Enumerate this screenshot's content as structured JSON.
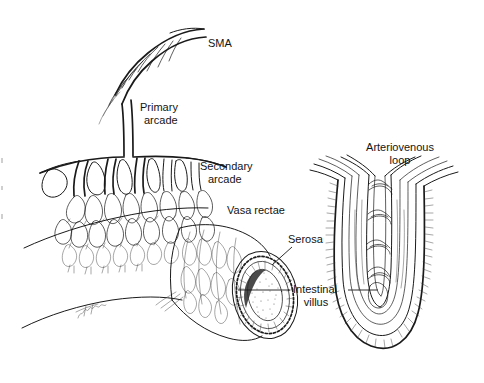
{
  "figure": {
    "background_color": "#ffffff",
    "ink_color": "#1a1a1a",
    "width": 484,
    "height": 383
  },
  "labels": {
    "sma": "SMA",
    "primary_arcade_line1": "Primary",
    "primary_arcade_line2": "arcade",
    "secondary_arcade_line1": "Secondary",
    "secondary_arcade_line2": "arcade",
    "vasa_rectae": "Vasa rectae",
    "serosa": "Serosa",
    "intestinal_villus_line1": "Intestinal",
    "intestinal_villus_line2": "villus",
    "arteriovenous_loop_line1": "Arteriovenous",
    "arteriovenous_loop_line2": "loop"
  },
  "panels": {
    "left": {
      "name": "mesenteric-vascular-arcade-and-bowel-segment",
      "structures": [
        "superior mesenteric artery",
        "primary arcade",
        "secondary arcade",
        "vasa rectae network",
        "small bowel segment cut in cross section",
        "serosa",
        "intestinal lumen"
      ]
    },
    "right": {
      "name": "intestinal-villus-arteriovenous-loop",
      "structures": [
        "intestinal villus",
        "brush border",
        "central arteriole",
        "venule",
        "capillary cross links",
        "arteriovenous loop"
      ]
    }
  },
  "signature": {
    "present": true,
    "description": "artist cursive signature on mesentery edge"
  }
}
